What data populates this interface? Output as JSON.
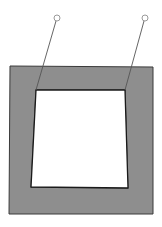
{
  "diagram": {
    "background": "#ffffff",
    "frame": {
      "fill": "#8e8e8e",
      "stroke": "#3a3a3a",
      "outer_points": "10,66 153,67 153,214 9,214",
      "inner_points": "36,90 125,90 128,188 31,187"
    },
    "opening": {
      "fill": "#ffffff",
      "stroke": "#1a1a1a",
      "points": "36,90 125,90 128,188 31,187"
    },
    "callouts": [
      {
        "x1": 36,
        "y1": 90,
        "x2": 56,
        "y2": 21,
        "cx": 57,
        "cy": 18,
        "r": 3
      },
      {
        "x1": 125,
        "y1": 90,
        "x2": 144,
        "y2": 21,
        "cx": 145,
        "cy": 18,
        "r": 3
      }
    ],
    "callout_stroke": "#555555",
    "marker_stroke": "#9a9a9a"
  }
}
